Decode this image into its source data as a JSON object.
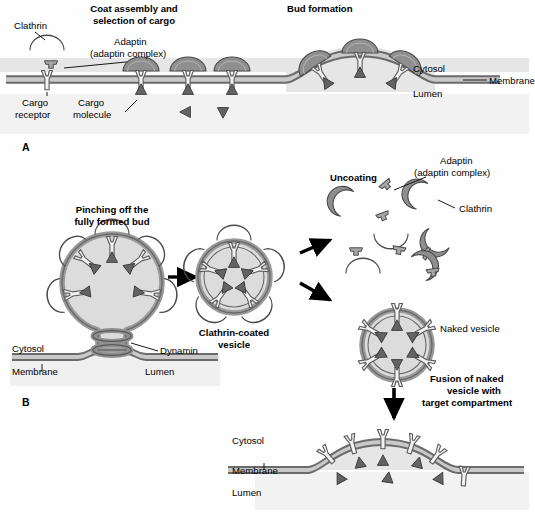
{
  "figure": {
    "title_a": "Coat assembly and\nselection of cargo",
    "title_a_line1": "Coat assembly and",
    "title_a_line2": "selection of cargo",
    "title_bud": "Bud formation",
    "panel_a_id": "A",
    "panel_b_id": "B"
  },
  "panel_a": {
    "clathrin_label": "Clathrin",
    "adaptin_label": "Adaptin",
    "adaptin_complex_label": "(adaptin complex)",
    "cargo_receptor_label": "Cargo\nreceptor",
    "cargo_receptor_line1": "Cargo",
    "cargo_receptor_line2": "receptor",
    "cargo_molecule_label": "Cargo\nmolecule",
    "cargo_molecule_line1": "Cargo",
    "cargo_molecule_line2": "molecule",
    "cytosol_label": "Cytosol",
    "membrane_label": "Membrane",
    "lumen_label": "Lumen"
  },
  "panel_b": {
    "pinching_line1": "Pinching off the",
    "pinching_line2": "fully formed bud",
    "dynamin_label": "Dynamin",
    "cytosol_label": "Cytosol",
    "membrane_label": "Membrane",
    "lumen_label": "Lumen",
    "ccv_line1": "Clathrin-coated",
    "ccv_line2": "vesicle",
    "uncoating_label": "Uncoating",
    "adaptin_label": "Adaptin",
    "adaptin_complex_label": "(adaptin complex)",
    "clathrin_label": "Clathrin",
    "naked_vesicle_label": "Naked vesicle",
    "fusion_line1": "Fusion of naked",
    "fusion_line2": "vesicle with",
    "fusion_line3": "target compartment",
    "target_cytosol_label": "Cytosol",
    "target_membrane_label": "Membrane",
    "target_lumen_label": "Lumen"
  },
  "colors": {
    "background": "#fefefe",
    "clathrin_fill": "#8f8f8f",
    "clathrin_stroke": "#4a4a4a",
    "adaptin_fill": "#a8a8a8",
    "membrane_dark": "#6b6b6b",
    "membrane_light": "#c9c9c9",
    "cytosol_shade": "#e3e3e3",
    "lumen_shade": "#ededed",
    "cargo_fill": "#636363",
    "receptor_fill": "#f2f2f2",
    "receptor_stroke": "#5a5a5a",
    "vesicle_lumen": "#dcdcdc",
    "arrow": "#000000",
    "text": "#000000"
  },
  "icons": {
    "clathrin": "clathrin-arc-icon",
    "adaptin": "adaptin-t-icon",
    "cargo_receptor": "receptor-y-icon",
    "cargo_molecule": "cargo-triangle-icon",
    "dynamin": "dynamin-coil-icon",
    "arrow": "arrow-icon"
  }
}
